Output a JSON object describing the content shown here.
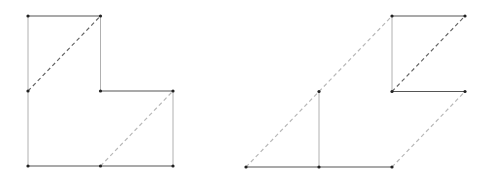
{
  "diagram": {
    "figures": [
      {
        "name": "left-figure",
        "points": [
          [
            0,
            2
          ],
          [
            1,
            2
          ],
          [
            0,
            1
          ],
          [
            1,
            1
          ],
          [
            2,
            1
          ],
          [
            0,
            0
          ],
          [
            1,
            0
          ],
          [
            2,
            0
          ]
        ],
        "segments": [
          {
            "from": 0,
            "to": 1,
            "style": "solid-dark"
          },
          {
            "from": 0,
            "to": 2,
            "style": "solid-light"
          },
          {
            "from": 1,
            "to": 3,
            "style": "solid-light"
          },
          {
            "from": 3,
            "to": 4,
            "style": "solid-dark"
          },
          {
            "from": 2,
            "to": 5,
            "style": "solid-light"
          },
          {
            "from": 4,
            "to": 7,
            "style": "solid-light"
          },
          {
            "from": 5,
            "to": 6,
            "style": "solid-dark"
          },
          {
            "from": 6,
            "to": 7,
            "style": "solid-dark"
          },
          {
            "from": 2,
            "to": 1,
            "style": "dash-dark"
          },
          {
            "from": 6,
            "to": 4,
            "style": "dash-light"
          }
        ]
      },
      {
        "name": "right-figure",
        "points": [
          [
            2,
            2
          ],
          [
            3,
            2
          ],
          [
            2,
            1
          ],
          [
            3,
            1
          ],
          [
            1,
            1
          ],
          [
            0,
            0
          ],
          [
            1,
            0
          ],
          [
            2,
            0
          ]
        ],
        "segments": [
          {
            "from": 0,
            "to": 1,
            "style": "solid-dark"
          },
          {
            "from": 0,
            "to": 2,
            "style": "solid-light"
          },
          {
            "from": 2,
            "to": 3,
            "style": "solid-dark"
          },
          {
            "from": 2,
            "to": 1,
            "style": "dash-dark"
          },
          {
            "from": 4,
            "to": 0,
            "style": "dash-light"
          },
          {
            "from": 4,
            "to": 6,
            "style": "solid-light"
          },
          {
            "from": 5,
            "to": 4,
            "style": "dash-light"
          },
          {
            "from": 5,
            "to": 6,
            "style": "solid-dark"
          },
          {
            "from": 6,
            "to": 7,
            "style": "solid-dark"
          },
          {
            "from": 7,
            "to": 3,
            "style": "dash-light"
          }
        ]
      }
    ]
  }
}
